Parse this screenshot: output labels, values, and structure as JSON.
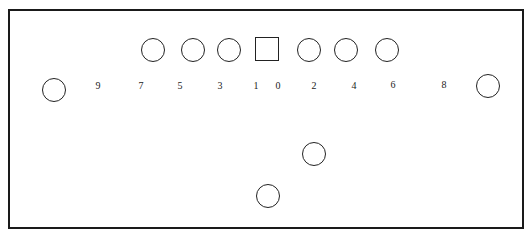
{
  "diagram": {
    "type": "football-formation",
    "frame": {
      "border_color": "#1a1a1a"
    },
    "line": {
      "center": {
        "shape": "square",
        "x": 267,
        "y": 49
      },
      "linemen": [
        {
          "id": "lt",
          "x": 153,
          "y": 50
        },
        {
          "id": "lg",
          "x": 193,
          "y": 50
        },
        {
          "id": "lg2",
          "x": 229,
          "y": 50
        },
        {
          "id": "rg",
          "x": 309,
          "y": 50
        },
        {
          "id": "rt",
          "x": 346,
          "y": 50
        },
        {
          "id": "te",
          "x": 387,
          "y": 50
        }
      ]
    },
    "receivers": [
      {
        "id": "split-left",
        "x": 54,
        "y": 90
      },
      {
        "id": "split-right",
        "x": 488,
        "y": 86
      }
    ],
    "backs": [
      {
        "id": "back-1",
        "x": 314,
        "y": 154
      },
      {
        "id": "back-2",
        "x": 268,
        "y": 196
      }
    ],
    "hole_numbers": [
      {
        "label": "9",
        "x": 98,
        "y": 86
      },
      {
        "label": "7",
        "x": 141,
        "y": 86
      },
      {
        "label": "5",
        "x": 180,
        "y": 86
      },
      {
        "label": "3",
        "x": 220,
        "y": 86
      },
      {
        "label": "1",
        "x": 256,
        "y": 86
      },
      {
        "label": "0",
        "x": 278,
        "y": 86
      },
      {
        "label": "2",
        "x": 314,
        "y": 86
      },
      {
        "label": "4",
        "x": 354,
        "y": 86
      },
      {
        "label": "6",
        "x": 393,
        "y": 85
      },
      {
        "label": "8",
        "x": 444,
        "y": 85
      }
    ]
  }
}
